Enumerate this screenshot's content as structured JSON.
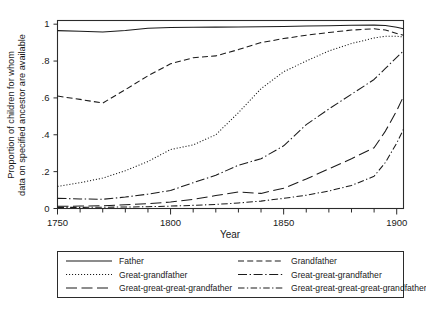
{
  "chart_data": {
    "type": "line",
    "title": "",
    "xlabel": "Year",
    "ylabel": "Proportion of children for whom data on specified ancestor are available",
    "ylabel_line1": "Proportion of children for whom",
    "ylabel_line2": "data on specified ancestor are available",
    "xlim": [
      1750,
      1903
    ],
    "ylim": [
      0,
      1.02
    ],
    "grid": false,
    "legend_position": "below-plot",
    "x_ticks_major": [
      1750,
      1800,
      1850,
      1900
    ],
    "x_tick_labels": [
      "1750",
      "1800",
      "1850",
      "1900"
    ],
    "x_ticks_minor": [
      1760,
      1770,
      1780,
      1790,
      1810,
      1820,
      1830,
      1840,
      1860,
      1870,
      1880,
      1890
    ],
    "y_ticks": [
      0,
      0.2,
      0.4,
      0.6,
      0.8,
      1
    ],
    "y_tick_labels": [
      "0",
      ".2",
      ".4",
      ".6",
      ".8",
      "1"
    ],
    "x": [
      1750,
      1760,
      1770,
      1780,
      1790,
      1800,
      1810,
      1820,
      1830,
      1840,
      1850,
      1860,
      1870,
      1880,
      1890,
      1895,
      1900,
      1903
    ],
    "series": [
      {
        "name": "Father",
        "dash": "none",
        "values": [
          0.965,
          0.962,
          0.958,
          0.966,
          0.978,
          0.982,
          0.983,
          0.984,
          0.985,
          0.986,
          0.988,
          0.99,
          0.992,
          0.994,
          0.995,
          0.993,
          0.983,
          0.975
        ]
      },
      {
        "name": "Grandfather",
        "dash": "dashed",
        "values": [
          0.61,
          0.592,
          0.572,
          0.645,
          0.72,
          0.785,
          0.818,
          0.828,
          0.862,
          0.9,
          0.922,
          0.94,
          0.955,
          0.968,
          0.975,
          0.968,
          0.95,
          0.94
        ]
      },
      {
        "name": "Great-grandfather",
        "dash": "dotted",
        "values": [
          0.12,
          0.14,
          0.165,
          0.205,
          0.255,
          0.32,
          0.345,
          0.4,
          0.52,
          0.65,
          0.742,
          0.8,
          0.855,
          0.895,
          0.925,
          0.935,
          0.935,
          0.93
        ]
      },
      {
        "name": "Great-great-grandfather",
        "dash": "dashdot",
        "values": [
          0.055,
          0.052,
          0.05,
          0.062,
          0.078,
          0.098,
          0.14,
          0.18,
          0.235,
          0.27,
          0.34,
          0.455,
          0.54,
          0.62,
          0.7,
          0.76,
          0.82,
          0.855
        ]
      },
      {
        "name": "Great-great-great-grandfather",
        "dash": "longdash",
        "values": [
          0.012,
          0.013,
          0.015,
          0.02,
          0.026,
          0.035,
          0.05,
          0.07,
          0.09,
          0.082,
          0.11,
          0.16,
          0.215,
          0.27,
          0.33,
          0.42,
          0.53,
          0.608
        ]
      },
      {
        "name": "Great-great-great-great-grandfather",
        "dash": "dashdotdot",
        "values": [
          0.006,
          0.006,
          0.007,
          0.008,
          0.01,
          0.013,
          0.017,
          0.022,
          0.03,
          0.04,
          0.055,
          0.072,
          0.095,
          0.125,
          0.175,
          0.25,
          0.355,
          0.43
        ]
      }
    ]
  },
  "legend": {
    "entries": [
      {
        "label": "Father",
        "dash": "none",
        "icon": "line-solid-icon"
      },
      {
        "label": "Grandfather",
        "dash": "dashed",
        "icon": "line-dashed-icon"
      },
      {
        "label": "Great-grandfather",
        "dash": "dotted",
        "icon": "line-dotted-icon"
      },
      {
        "label": "Great-great-grandfather",
        "dash": "dashdot",
        "icon": "line-dashdot-icon"
      },
      {
        "label": "Great-great-great-grandfather",
        "dash": "longdash",
        "icon": "line-longdash-icon"
      },
      {
        "label": "Great-great-great-great-grandfather",
        "dash": "dashdotdot",
        "icon": "line-dashdotdot-icon"
      }
    ]
  },
  "colors": {
    "ink": "#1a1a1a",
    "axis": "#2b2b2b",
    "background": "#ffffff"
  }
}
